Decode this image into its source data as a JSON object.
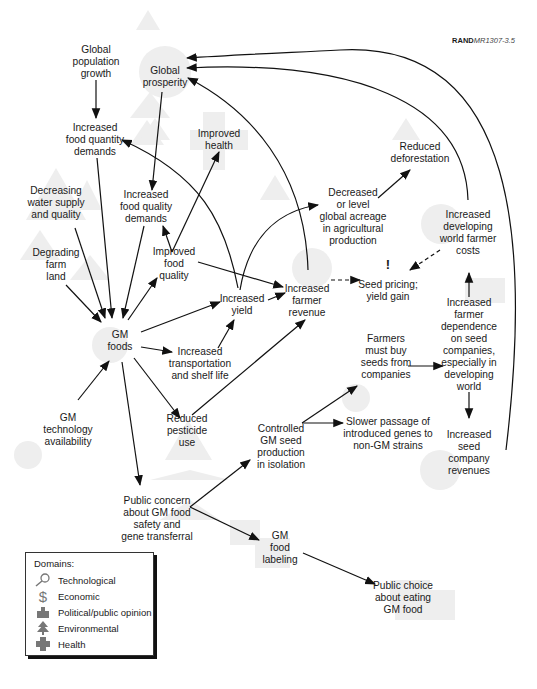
{
  "reference": {
    "bold": "RAND",
    "italic": "MR1307-3.5"
  },
  "nodes": {
    "global_population_growth": "Global\npopulation\ngrowth",
    "global_prosperity": "Global\nprosperity",
    "increased_food_quantity_demands": "Increased\nfood quantity\ndemands",
    "improved_health": "Improved\nhealth",
    "reduced_deforestation": "Reduced\ndeforestation",
    "decreasing_water_supply": "Decreasing\nwater supply\nand quality",
    "increased_food_quality_demands": "Increased\nfood quality\ndemands",
    "decreased_acreage": "Decreased\nor level\nglobal acreage\nin agricultural\nproduction",
    "increased_developing_world_farmer_costs": "Increased\ndeveloping\nworld farmer\ncosts",
    "degrading_farm_land": "Degrading\nfarm\nland",
    "improved_food_quality": "Improved\nfood\nquality",
    "increased_farmer_revenue": "Increased\nfarmer\nrevenue",
    "seed_pricing": "Seed pricing;\nyield gain",
    "increased_yield": "Increased\nyield",
    "gm_foods": "GM\nfoods",
    "increased_transportation": "Increased\ntransportation\nand shelf life",
    "farmers_must_buy_seeds": "Farmers\nmust buy\nseeds from\ncompanies",
    "increased_farmer_dependence": "Increased\nfarmer\ndependence\non seed\ncompanies,\nespecially in\ndeveloping\nworld",
    "gm_technology_availability": "GM\ntechnology\navailability",
    "reduced_pesticide_use": "Reduced\npesticide\nuse",
    "controlled_gm_seed_production": "Controlled\nGM seed\nproduction\nin isolation",
    "slower_passage": "Slower passage of\nintroduced genes to\nnon-GM strains",
    "increased_seed_company_revenues": "Increased\nseed\ncompany\nrevenues",
    "public_concern": "Public concern\nabout GM food\nsafety and\ngene transferral",
    "gm_food_labeling": "GM\nfood\nlabeling",
    "public_choice": "Public choice\nabout eating\nGM food"
  },
  "annotation": "!",
  "legend": {
    "title": "Domains:",
    "items": [
      {
        "icon": "magnifier-icon",
        "label": "Technological"
      },
      {
        "icon": "dollar-icon",
        "label": "Economic"
      },
      {
        "icon": "capitol-icon",
        "label": "Political/public opinion"
      },
      {
        "icon": "tree-icon",
        "label": "Environmental"
      },
      {
        "icon": "cross-icon",
        "label": "Health"
      }
    ]
  },
  "colors": {
    "line": "#111111",
    "icon_bg": "#ececec",
    "legend_icon": "#7a7a7a"
  }
}
